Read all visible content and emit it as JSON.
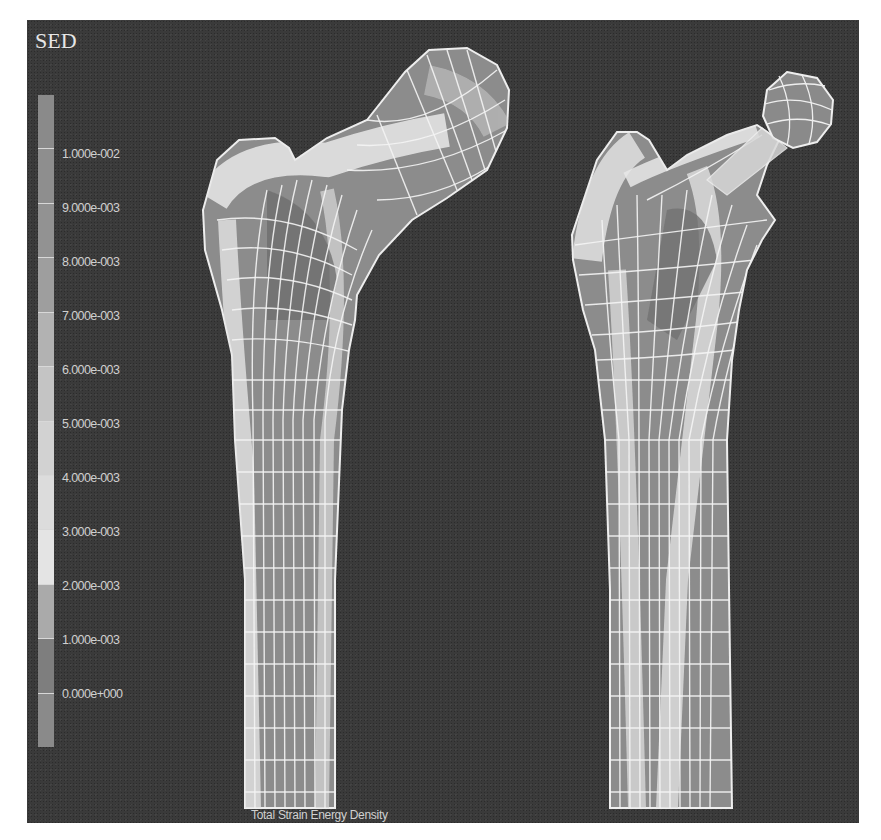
{
  "figure": {
    "legend": {
      "title": "SED",
      "ticks": [
        {
          "label": "1.000e-002",
          "y": 154
        },
        {
          "label": "9.000e-003",
          "y": 208
        },
        {
          "label": "8.000e-003",
          "y": 262
        },
        {
          "label": "7.000e-003",
          "y": 316
        },
        {
          "label": "6.000e-003",
          "y": 370
        },
        {
          "label": "5.000e-003",
          "y": 424
        },
        {
          "label": "4.000e-003",
          "y": 478
        },
        {
          "label": "3.000e-003",
          "y": 532
        },
        {
          "label": "2.000e-003",
          "y": 586
        },
        {
          "label": "1.000e-003",
          "y": 640
        },
        {
          "label": "0.000e+000",
          "y": 694
        }
      ],
      "band_colors": [
        "#8a8a8a",
        "#8e8e8e",
        "#929292",
        "#9e9e9e",
        "#b2b2b2",
        "#c4c4c4",
        "#d2d2d2",
        "#dcdcdc",
        "#e4e4e4",
        "#aaaaaa",
        "#7e7e7e",
        "#8a8a8a"
      ]
    },
    "caption": "Total Strain Energy Density",
    "models": [
      {
        "name": "intact-femur"
      },
      {
        "name": "implanted-femur"
      }
    ],
    "colors": {
      "background": "#3a3a3a",
      "paper": "#ffffff",
      "mesh": "#f2f2f2",
      "bone_low": "#6e6e6e",
      "bone_high": "#e8e8e8"
    }
  }
}
